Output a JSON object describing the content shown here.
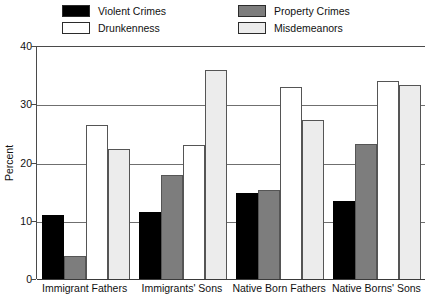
{
  "chart_data": {
    "type": "bar",
    "title": "",
    "subtitle": "",
    "xlabel": "",
    "ylabel": "Percent",
    "ylim": [
      0,
      40
    ],
    "yticks": [
      0,
      10,
      20,
      30,
      40
    ],
    "grid": true,
    "legend_position": "top",
    "categories": [
      "Immigrant Fathers",
      "Immigrants' Sons",
      "Native Born Fathers",
      "Native Borns' Sons"
    ],
    "series": [
      {
        "name": "Violent Crimes",
        "color": "#000000",
        "values": [
          11.0,
          11.5,
          14.7,
          13.4
        ]
      },
      {
        "name": "Property Crimes",
        "color": "#7d7d7d",
        "values": [
          4.0,
          17.8,
          15.3,
          23.2
        ]
      },
      {
        "name": "Drunkenness",
        "color": "#ffffff",
        "values": [
          26.5,
          23.0,
          33.0,
          34.0
        ]
      },
      {
        "name": "Misdemeanors",
        "color": "#ececec",
        "values": [
          22.3,
          35.8,
          27.3,
          33.3
        ]
      }
    ]
  },
  "legend": {
    "items": [
      {
        "label": "Violent Crimes",
        "color": "#000000"
      },
      {
        "label": "Property Crimes",
        "color": "#7d7d7d"
      },
      {
        "label": "Drunkenness",
        "color": "#ffffff"
      },
      {
        "label": "Misdemeanors",
        "color": "#ececec"
      }
    ]
  },
  "axis": {
    "y_title": "Percent",
    "y_tick_labels": [
      "0",
      "10",
      "20",
      "30",
      "40"
    ]
  }
}
